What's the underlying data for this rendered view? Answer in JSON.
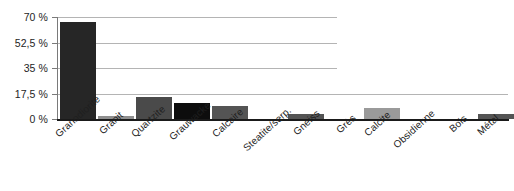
{
  "chart_data": {
    "type": "bar",
    "title": "",
    "subtitle": "",
    "xlabel": "",
    "ylabel": "",
    "categories": [
      "Granodiorite",
      "Granit",
      "Quartzite",
      "Grauwacke",
      "Calcaire",
      "Steatite/serp.",
      "Gneiss",
      "Grès",
      "Calcite",
      "Obsidienne",
      "Bois",
      "Métal"
    ],
    "values": [
      66.5,
      2,
      15,
      11,
      9,
      0.3,
      3.5,
      0.3,
      7.5,
      0.3,
      0,
      3.5
    ],
    "bar_colors": [
      "#262626",
      "#8f8f8f",
      "#4a4a4a",
      "#0d0d0d",
      "#545454",
      "#6b6b6b",
      "#545454",
      "#6b6b6b",
      "#9a9a9a",
      "#6b6b6b",
      "#6b6b6b",
      "#545454"
    ],
    "ylim": [
      0,
      70
    ],
    "yticks": [
      0,
      17.5,
      35,
      52.5,
      70
    ],
    "ytick_labels": [
      "0 %",
      "17,5 %",
      "35 %",
      "52,5 %",
      "70 %"
    ],
    "grid": true,
    "grid_color": "#b4b4b4",
    "legend": null,
    "legend_position": "none",
    "axis_color": "#1a1a1a",
    "background": "#ffffff",
    "unit": "%"
  }
}
